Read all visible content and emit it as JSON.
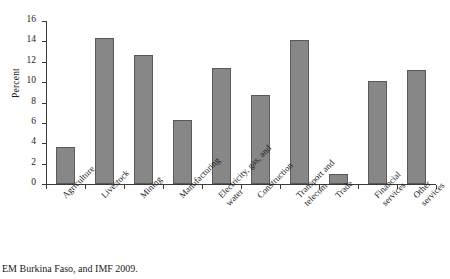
{
  "chart_data": {
    "type": "bar",
    "title": "",
    "subtitle": "",
    "xlabel": "",
    "ylabel": "Percent",
    "ylim": [
      0,
      16
    ],
    "yticks": [
      0,
      2,
      4,
      6,
      8,
      10,
      12,
      14,
      16
    ],
    "grid": false,
    "legend": null,
    "categories": [
      "Agriculture",
      "Livestock",
      "Mining",
      "Manufacturing",
      "Electricity, gas, and\nwater",
      "Construction",
      "Transport and\ntelecom",
      "Trade",
      "Financial services",
      "Other services"
    ],
    "values": [
      3.6,
      14.3,
      12.7,
      6.3,
      11.4,
      8.7,
      14.1,
      1.0,
      10.1,
      11.2
    ],
    "bar_color": "#878787",
    "bar_edge_color": "#5a5a5a",
    "axis_color": "#3a3a3a"
  },
  "footer": {
    "source_note": "EM Burkina Faso, and IMF 2009."
  }
}
